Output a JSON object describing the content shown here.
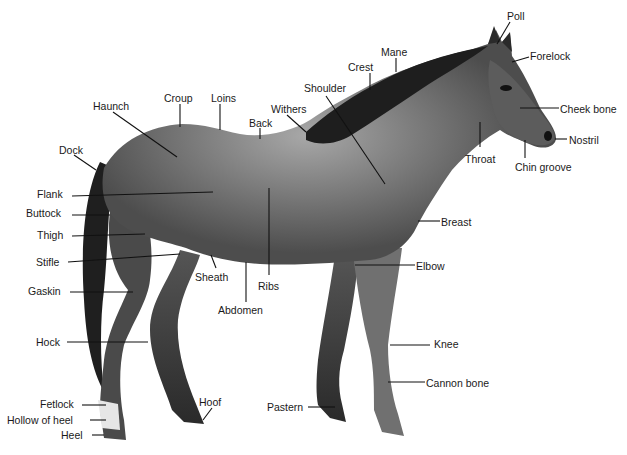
{
  "colors": {
    "background": "#ffffff",
    "label": "#1a1a1a",
    "leader": "#111111",
    "coat_dark": "#2b2b2b",
    "coat_mid": "#5a5a5a",
    "coat_light": "#9a9a9a",
    "white_marking": "#e8e8e8"
  },
  "labels": [
    {
      "id": "poll",
      "text": "Poll",
      "x": 507,
      "y": 10,
      "line": [
        510,
        22,
        497,
        44
      ]
    },
    {
      "id": "forelock",
      "text": "Forelock",
      "x": 530,
      "y": 50,
      "line": [
        529,
        57,
        512,
        62
      ]
    },
    {
      "id": "mane",
      "text": "Mane",
      "x": 381,
      "y": 46,
      "line": [
        396,
        58,
        396,
        72
      ]
    },
    {
      "id": "crest",
      "text": "Crest",
      "x": 348,
      "y": 61,
      "line": [
        370,
        73,
        370,
        90
      ]
    },
    {
      "id": "shoulder",
      "text": "Shoulder",
      "x": 304,
      "y": 82,
      "line": [
        326,
        96,
        385,
        184
      ]
    },
    {
      "id": "cheek-bone",
      "text": "Cheek bone",
      "x": 560,
      "y": 103,
      "line": [
        559,
        108,
        520,
        108
      ]
    },
    {
      "id": "withers",
      "text": "Withers",
      "x": 271,
      "y": 103,
      "line": [
        287,
        115,
        306,
        132
      ]
    },
    {
      "id": "croup",
      "text": "Croup",
      "x": 164,
      "y": 92,
      "line": [
        180,
        104,
        180,
        127
      ]
    },
    {
      "id": "loins",
      "text": "Loins",
      "x": 211,
      "y": 92,
      "line": [
        220,
        104,
        220,
        130
      ]
    },
    {
      "id": "haunch",
      "text": "Haunch",
      "x": 93,
      "y": 100,
      "line": [
        113,
        112,
        177,
        157
      ]
    },
    {
      "id": "back",
      "text": "Back",
      "x": 249,
      "y": 117,
      "line": [
        260,
        128,
        260,
        139
      ]
    },
    {
      "id": "nostril",
      "text": "Nostril",
      "x": 569,
      "y": 134,
      "line": [
        567,
        139,
        555,
        139
      ]
    },
    {
      "id": "dock",
      "text": "Dock",
      "x": 59,
      "y": 144,
      "line": [
        74,
        155,
        96,
        170
      ]
    },
    {
      "id": "throat",
      "text": "Throat",
      "x": 465,
      "y": 153,
      "line": [
        480,
        122,
        480,
        147
      ]
    },
    {
      "id": "chin-groove",
      "text": "Chin groove",
      "x": 515,
      "y": 161,
      "line": [
        525,
        140,
        525,
        158
      ]
    },
    {
      "id": "flank",
      "text": "Flank",
      "x": 37,
      "y": 188,
      "line": [
        72,
        196,
        213,
        192
      ]
    },
    {
      "id": "buttock",
      "text": "Buttock",
      "x": 26,
      "y": 207,
      "line": [
        72,
        215,
        110,
        215
      ]
    },
    {
      "id": "breast",
      "text": "Breast",
      "x": 441,
      "y": 216,
      "line": [
        418,
        221,
        440,
        221
      ]
    },
    {
      "id": "thigh",
      "text": "Thigh",
      "x": 37,
      "y": 229,
      "line": [
        72,
        236,
        145,
        234
      ]
    },
    {
      "id": "stifle",
      "text": "Stifle",
      "x": 36,
      "y": 256,
      "line": [
        68,
        262,
        180,
        254
      ]
    },
    {
      "id": "sheath",
      "text": "Sheath",
      "x": 195,
      "y": 271,
      "line": [
        216,
        268,
        211,
        255
      ]
    },
    {
      "id": "elbow",
      "text": "Elbow",
      "x": 416,
      "y": 260,
      "line": [
        355,
        265,
        415,
        265
      ]
    },
    {
      "id": "ribs",
      "text": "Ribs",
      "x": 258,
      "y": 280,
      "line": [
        269,
        188,
        269,
        275
      ]
    },
    {
      "id": "gaskin",
      "text": "Gaskin",
      "x": 28,
      "y": 285,
      "line": [
        70,
        292,
        133,
        292
      ]
    },
    {
      "id": "abdomen",
      "text": "Abdomen",
      "x": 218,
      "y": 304,
      "line": [
        246,
        262,
        246,
        302
      ]
    },
    {
      "id": "knee",
      "text": "Knee",
      "x": 434,
      "y": 338,
      "line": [
        390,
        345,
        430,
        345
      ]
    },
    {
      "id": "hock",
      "text": "Hock",
      "x": 36,
      "y": 336,
      "line": [
        67,
        342,
        148,
        342
      ]
    },
    {
      "id": "cannon-bone",
      "text": "Cannon bone",
      "x": 426,
      "y": 377,
      "line": [
        388,
        382,
        425,
        382
      ]
    },
    {
      "id": "hoof",
      "text": "Hoof",
      "x": 199,
      "y": 396,
      "line": [
        212,
        408,
        203,
        420
      ]
    },
    {
      "id": "fetlock",
      "text": "Fetlock",
      "x": 40,
      "y": 398,
      "line": [
        82,
        405,
        106,
        405
      ]
    },
    {
      "id": "pastern",
      "text": "Pastern",
      "x": 267,
      "y": 401,
      "line": [
        308,
        407,
        335,
        407
      ]
    },
    {
      "id": "hollow-of-heel",
      "text": "Hollow of heel",
      "x": 7,
      "y": 414,
      "line": [
        90,
        420,
        106,
        420
      ]
    },
    {
      "id": "heel",
      "text": "Heel",
      "x": 61,
      "y": 429,
      "line": [
        92,
        435,
        104,
        435
      ]
    }
  ]
}
